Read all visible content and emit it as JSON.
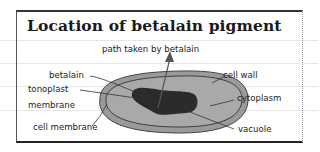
{
  "diagram": {
    "title": "Location of betalain pigment",
    "labels": {
      "path": "path taken by betalain",
      "betalain": "betalain",
      "cell_wall": "cell wall",
      "tonoplast_line1": "tonoplast",
      "tonoplast_line2": "membrane",
      "cytoplasm": "cytoplasm",
      "cell_membrane": "cell membrane",
      "vacuole": "vacuole"
    },
    "colors": {
      "cell_wall_fill": "#9a9a9a",
      "cytoplasm_fill": "#a8a8a8",
      "vacuole_fill": "#2b2b2b",
      "line": "#333333"
    }
  }
}
